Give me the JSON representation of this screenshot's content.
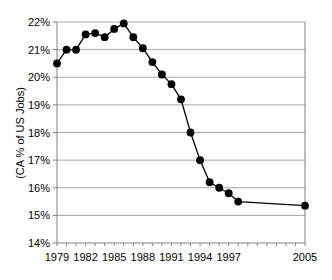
{
  "chart_data": {
    "type": "line",
    "title": "",
    "subtitle": "",
    "xlabel": "",
    "ylabel": "(CA % of US Jobs)",
    "ylim": [
      14,
      22
    ],
    "ytick_labels": [
      "14%",
      "15%",
      "16%",
      "17%",
      "18%",
      "19%",
      "20%",
      "21%",
      "22%"
    ],
    "ytick_values": [
      14,
      15,
      16,
      17,
      18,
      19,
      20,
      21,
      22
    ],
    "xlim": [
      1979,
      2005
    ],
    "xtick_labels": [
      "1979",
      "1982",
      "1985",
      "1988",
      "1991",
      "1994",
      "1997",
      "2005"
    ],
    "xtick_values": [
      1979,
      1982,
      1985,
      1988,
      1991,
      1994,
      1997,
      2005
    ],
    "grid": "horizontal",
    "legend": "none",
    "marker": "filled-circle",
    "line_color": "#000000",
    "marker_color": "#000000",
    "grid_color": "#a6a6a6",
    "axis_color": "#808080",
    "background_color": "#ffffff",
    "x": [
      1979,
      1980,
      1981,
      1982,
      1983,
      1984,
      1985,
      1986,
      1987,
      1988,
      1989,
      1990,
      1991,
      1992,
      1993,
      1994,
      1995,
      1996,
      1997,
      1998,
      2005
    ],
    "values": [
      20.5,
      21.0,
      21.0,
      21.55,
      21.6,
      21.45,
      21.75,
      21.95,
      21.45,
      21.05,
      20.55,
      20.1,
      19.75,
      19.2,
      18.0,
      17.0,
      16.2,
      16.0,
      15.8,
      15.5,
      15.35
    ],
    "series": [
      {
        "name": "CA % of US Jobs",
        "values": [
          20.5,
          21.0,
          21.0,
          21.55,
          21.6,
          21.45,
          21.75,
          21.95,
          21.45,
          21.05,
          20.55,
          20.1,
          19.75,
          19.2,
          18.0,
          17.0,
          16.2,
          16.0,
          15.8,
          15.5,
          15.35
        ]
      }
    ],
    "annotations": []
  }
}
